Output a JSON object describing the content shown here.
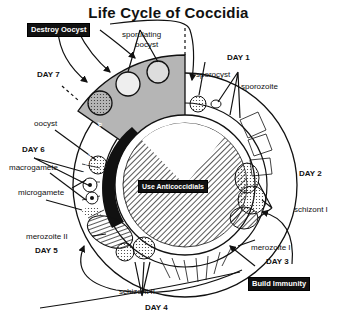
{
  "title": "Life Cycle of Coccidia",
  "days": {
    "day1": "DAY 1",
    "day2": "DAY 2",
    "day3": "DAY 3",
    "day4": "DAY 4",
    "day5": "DAY 5",
    "day6": "DAY 6",
    "day7": "DAY 7"
  },
  "stages": {
    "sporulating_oocyst_line1": "sporulating",
    "sporulating_oocyst_line2": "oocyst",
    "sporocyst": "sporocyst",
    "sporozoite": "sporozoite",
    "schizont1": "schizont I",
    "merozoite1": "merozoite I",
    "schizont2": "schizont II",
    "merozoite2": "merozoite II",
    "microgamete": "microgamete",
    "macrogamete": "macrogamete",
    "oocyst": "oocyst"
  },
  "callouts": {
    "destroy_oocyst": "Destroy Oocyst",
    "build_immunity": "Build Immunity",
    "use_anticoccidials": "Use Anticoccidials",
    "diarrhea": "Diarrhea with blood"
  },
  "colors": {
    "ink": "#111111",
    "shaded_sector": "#b5b5b5",
    "background": "#ffffff"
  }
}
